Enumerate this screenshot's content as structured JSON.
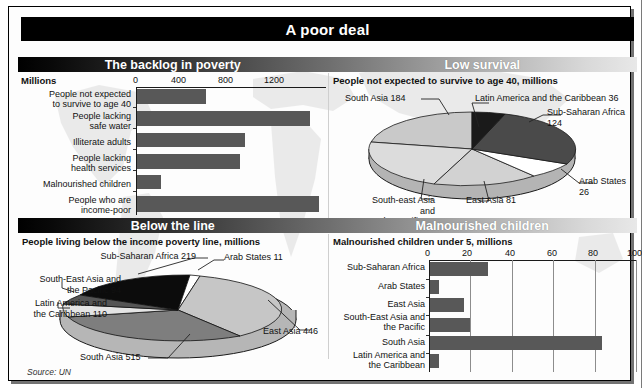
{
  "header": {
    "title": "A poor deal"
  },
  "bands": {
    "top_left": "The backlog in poverty",
    "top_right": "Low survival",
    "bottom_left": "Below the line",
    "bottom_right": "Malnourished children"
  },
  "source": "Source: UN",
  "colors": {
    "bar_fill": "#585858",
    "band_dark": "#000000",
    "band_light": "#e8e8e8",
    "pie_black": "#000000",
    "pie_dark_gray": "#4a4a4a",
    "pie_mid_gray": "#6f6f6f",
    "pie_light_gray": "#c9c9c9",
    "pie_pale": "#dedede",
    "pie_white": "#ffffff"
  },
  "chart_data": [
    {
      "id": "backlog-in-poverty",
      "type": "bar",
      "orientation": "horizontal",
      "title": "The backlog in poverty",
      "unit_label": "Millions",
      "xlabel": "",
      "ylabel": "",
      "xlim": [
        0,
        1500
      ],
      "ticks": [
        "0",
        "400",
        "800",
        "1200"
      ],
      "tick_values": [
        0,
        400,
        800,
        1200
      ],
      "grid": false,
      "categories": [
        "People not expected to survive to age 40",
        "People lacking safe water",
        "Illiterate adults",
        "People lacking health services",
        "Malnourished children",
        "People who are income-poor"
      ],
      "category_lines": [
        [
          "People not expected",
          "to survive to age 40"
        ],
        [
          "People lacking",
          "safe water"
        ],
        [
          "Illiterate adults"
        ],
        [
          "People lacking",
          "health services"
        ],
        [
          "Malnourished children"
        ],
        [
          "People who are",
          "income-poor"
        ]
      ],
      "values": [
        545,
        1365,
        855,
        810,
        190,
        1440
      ]
    },
    {
      "id": "low-survival",
      "type": "pie",
      "title": "Low survival",
      "caption": "People not expected to survive to age 40, millions",
      "unit": "millions",
      "legend_position": "callouts",
      "slices": [
        {
          "label": "South Asia",
          "value": 184,
          "label_text": "South Asia 184",
          "color": "#c9c9c9"
        },
        {
          "label": "Latin America and the Caribbean",
          "value": 36,
          "label_text": "Latin America and the Caribbean 36",
          "color": "#1a1a1a"
        },
        {
          "label": "Sub-Saharan Africa",
          "value": 124,
          "label_text": "Sub-Saharan Africa 124",
          "color": "#4a4a4a"
        },
        {
          "label": "Arab States",
          "value": 26,
          "label_text": "Arab States 26",
          "color": "#ffffff"
        },
        {
          "label": "East Asia",
          "value": 81,
          "label_text": "East Asia 81",
          "color": "#d2d2d2"
        },
        {
          "label": "South-east Asia and the Pacific",
          "value": 52,
          "label_text": "South-east Asia and the Pacific 52",
          "color": "#dcdcdc"
        }
      ],
      "callouts": {
        "south_asia": "South Asia 184",
        "latin_america": "Latin America and the Caribbean 36",
        "sub_saharan": "Sub-Saharan Africa 124",
        "arab_states": "Arab States 26",
        "east_asia": "East Asia 81",
        "south_east_asia_l1": "South-east Asia and",
        "south_east_asia_l2": "the Pacific 52"
      }
    },
    {
      "id": "below-the-line",
      "type": "pie",
      "title": "Below the line",
      "caption": "People living below the income poverty line, millions",
      "unit": "millions",
      "legend_position": "callouts",
      "slices": [
        {
          "label": "Sub-Saharan Africa",
          "value": 219,
          "label_text": "Sub-Saharan Africa 219",
          "color": "#0c0c0c"
        },
        {
          "label": "Arab States",
          "value": 11,
          "label_text": "Arab States 11",
          "color": "#ffffff"
        },
        {
          "label": "East Asia",
          "value": 446,
          "label_text": "East Asia 446",
          "color": "#c6c6c6"
        },
        {
          "label": "South Asia",
          "value": 515,
          "label_text": "South Asia 515",
          "color": "#7e7e7e"
        },
        {
          "label": "Latin America and the Caribbean",
          "value": 110,
          "label_text": "Latin America and the Caribbean 110",
          "color": "#e4e4e4"
        },
        {
          "label": "South-East Asia and the Pacific",
          "value": 94,
          "label_text": "South-East Asia and the Pacific 94",
          "color": "#555555"
        }
      ],
      "callouts": {
        "sub_saharan": "Sub-Saharan Africa 219",
        "arab_states": "Arab States 11",
        "east_asia": "East Asia 446",
        "south_asia": "South Asia 515",
        "latin_america_l1": "Latin America and",
        "latin_america_l2": "the Caribbean 110",
        "south_east_asia_l1": "South-East Asia and",
        "south_east_asia_l2": "the Pacific 94"
      }
    },
    {
      "id": "malnourished-children",
      "type": "bar",
      "orientation": "horizontal",
      "title": "Malnourished children",
      "caption": "Malnourished children under 5, millions",
      "xlim": [
        0,
        100
      ],
      "ticks": [
        "0",
        "20",
        "40",
        "60",
        "80",
        "100"
      ],
      "tick_values": [
        0,
        20,
        40,
        60,
        80,
        100
      ],
      "grid": true,
      "categories": [
        "Sub-Saharan Africa",
        "Arab States",
        "East Asia",
        "South-East Asia and the Pacific",
        "South Asia",
        "Latin America and the Caribbean"
      ],
      "category_lines": [
        [
          "Sub-Saharan Africa"
        ],
        [
          "Arab States"
        ],
        [
          "East Asia"
        ],
        [
          "South-East Asia and",
          "the Pacific"
        ],
        [
          "South Asia"
        ],
        [
          "Latin America and",
          "the Caribbean"
        ]
      ],
      "values": [
        28,
        4.3,
        16.5,
        19.5,
        83,
        4.5
      ]
    }
  ]
}
